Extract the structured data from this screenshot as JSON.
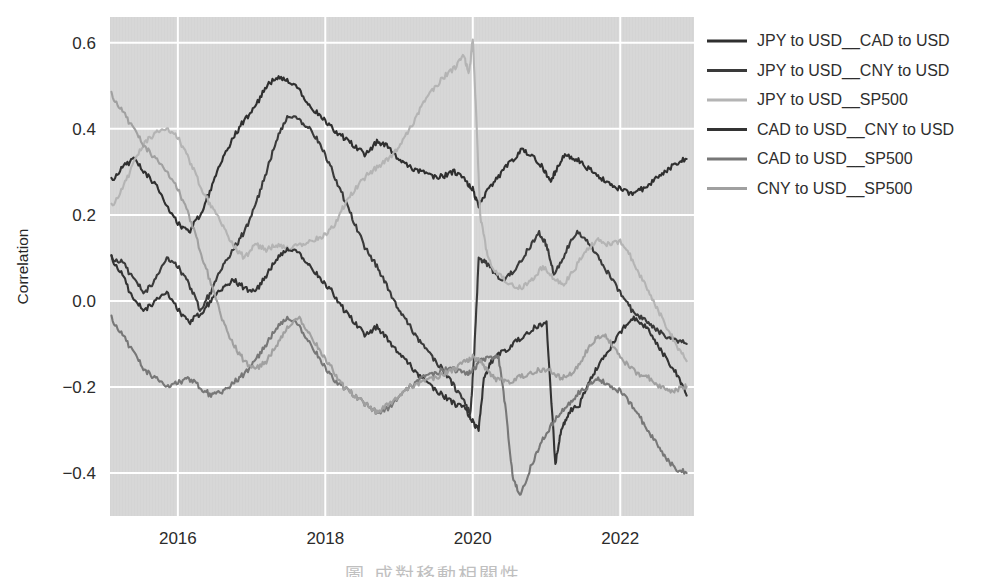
{
  "chart_data": {
    "type": "line",
    "title": "",
    "xlabel": "",
    "ylabel": "Correlation",
    "xlim": [
      2015.08,
      2023.0
    ],
    "ylim": [
      -0.5,
      0.66
    ],
    "grid": true,
    "grid_color": "#ffffff",
    "plot_background": "#d7d7d7",
    "figure_background": "#ffffff",
    "legend_position": "right-outside",
    "x_ticks": [
      "2016",
      "2018",
      "2020",
      "2022"
    ],
    "x_tick_values": [
      2016,
      2018,
      2020,
      2022
    ],
    "y_ticks": [
      "0.6",
      "0.4",
      "0.2",
      "0.0",
      "−0.2",
      "−0.4"
    ],
    "y_tick_values": [
      0.6,
      0.4,
      0.2,
      0.0,
      -0.2,
      -0.4
    ],
    "series": [
      {
        "name": "JPY to USD__CAD to USD",
        "color": "#2f2f2f",
        "x": [
          2015.1,
          2015.25,
          2015.4,
          2015.55,
          2015.7,
          2015.85,
          2016.0,
          2016.15,
          2016.3,
          2016.45,
          2016.6,
          2016.75,
          2016.9,
          2017.05,
          2017.2,
          2017.35,
          2017.5,
          2017.65,
          2017.8,
          2017.95,
          2018.1,
          2018.25,
          2018.4,
          2018.55,
          2018.7,
          2018.85,
          2019.0,
          2019.15,
          2019.3,
          2019.45,
          2019.6,
          2019.75,
          2019.9,
          2020.0,
          2020.08,
          2020.2,
          2020.35,
          2020.5,
          2020.65,
          2020.8,
          2020.95,
          2021.05,
          2021.12,
          2021.25,
          2021.4,
          2021.55,
          2021.7,
          2021.85,
          2022.0,
          2022.15,
          2022.3,
          2022.45,
          2022.6,
          2022.75,
          2022.9
        ],
        "values": [
          0.28,
          0.31,
          0.33,
          0.3,
          0.27,
          0.22,
          0.18,
          0.16,
          0.2,
          0.26,
          0.33,
          0.38,
          0.42,
          0.45,
          0.5,
          0.52,
          0.51,
          0.49,
          0.45,
          0.43,
          0.4,
          0.38,
          0.36,
          0.34,
          0.37,
          0.36,
          0.33,
          0.31,
          0.3,
          0.29,
          0.29,
          0.3,
          0.28,
          0.26,
          0.22,
          0.26,
          0.29,
          0.32,
          0.35,
          0.34,
          0.31,
          0.28,
          0.3,
          0.34,
          0.33,
          0.31,
          0.29,
          0.27,
          0.26,
          0.25,
          0.26,
          0.28,
          0.3,
          0.32,
          0.33
        ]
      },
      {
        "name": "JPY to USD__CNY to USD",
        "color": "#3a3a3a",
        "x": [
          2015.1,
          2015.25,
          2015.4,
          2015.55,
          2015.7,
          2015.85,
          2016.0,
          2016.15,
          2016.3,
          2016.45,
          2016.6,
          2016.75,
          2016.9,
          2017.05,
          2017.2,
          2017.35,
          2017.5,
          2017.65,
          2017.8,
          2017.95,
          2018.1,
          2018.25,
          2018.4,
          2018.55,
          2018.7,
          2018.85,
          2019.0,
          2019.15,
          2019.3,
          2019.45,
          2019.6,
          2019.75,
          2019.9,
          2019.97,
          2020.02,
          2020.08,
          2020.18,
          2020.3,
          2020.45,
          2020.6,
          2020.75,
          2020.9,
          2021.0,
          2021.1,
          2021.25,
          2021.4,
          2021.55,
          2021.7,
          2021.85,
          2022.0,
          2022.15,
          2022.3,
          2022.45,
          2022.6,
          2022.75,
          2022.9
        ],
        "values": [
          0.1,
          0.09,
          0.05,
          0.02,
          0.05,
          0.1,
          0.08,
          0.04,
          -0.02,
          0.02,
          0.08,
          0.12,
          0.16,
          0.22,
          0.3,
          0.38,
          0.43,
          0.42,
          0.4,
          0.36,
          0.3,
          0.24,
          0.18,
          0.12,
          0.08,
          0.03,
          -0.02,
          -0.06,
          -0.1,
          -0.13,
          -0.16,
          -0.2,
          -0.24,
          -0.26,
          -0.12,
          0.1,
          0.09,
          0.06,
          0.05,
          0.08,
          0.12,
          0.16,
          0.13,
          0.06,
          0.11,
          0.16,
          0.14,
          0.1,
          0.06,
          0.02,
          -0.02,
          -0.04,
          -0.06,
          -0.08,
          -0.09,
          -0.1
        ]
      },
      {
        "name": "JPY to USD__SP500",
        "color": "#b4b4b4",
        "x": [
          2015.1,
          2015.25,
          2015.4,
          2015.55,
          2015.7,
          2015.85,
          2016.0,
          2016.15,
          2016.3,
          2016.45,
          2016.6,
          2016.75,
          2016.9,
          2017.05,
          2017.2,
          2017.35,
          2017.5,
          2017.65,
          2017.8,
          2017.95,
          2018.1,
          2018.25,
          2018.4,
          2018.55,
          2018.7,
          2018.85,
          2019.0,
          2019.15,
          2019.3,
          2019.45,
          2019.6,
          2019.75,
          2019.88,
          2019.95,
          2020.0,
          2020.05,
          2020.1,
          2020.2,
          2020.35,
          2020.5,
          2020.65,
          2020.8,
          2020.95,
          2021.1,
          2021.25,
          2021.4,
          2021.55,
          2021.7,
          2021.85,
          2022.0,
          2022.15,
          2022.3,
          2022.45,
          2022.6,
          2022.75,
          2022.9
        ],
        "values": [
          0.22,
          0.26,
          0.32,
          0.37,
          0.39,
          0.4,
          0.38,
          0.33,
          0.27,
          0.22,
          0.18,
          0.13,
          0.1,
          0.13,
          0.12,
          0.13,
          0.12,
          0.13,
          0.14,
          0.15,
          0.17,
          0.22,
          0.26,
          0.29,
          0.31,
          0.33,
          0.36,
          0.4,
          0.45,
          0.49,
          0.52,
          0.54,
          0.57,
          0.53,
          0.61,
          0.42,
          0.2,
          0.1,
          0.06,
          0.04,
          0.03,
          0.05,
          0.08,
          0.05,
          0.04,
          0.08,
          0.12,
          0.14,
          0.13,
          0.14,
          0.1,
          0.05,
          0.0,
          -0.05,
          -0.1,
          -0.14
        ]
      },
      {
        "name": "CAD to USD__CNY to USD",
        "color": "#333333",
        "x": [
          2015.1,
          2015.25,
          2015.4,
          2015.55,
          2015.7,
          2015.85,
          2016.0,
          2016.15,
          2016.3,
          2016.45,
          2016.6,
          2016.75,
          2016.9,
          2017.05,
          2017.2,
          2017.35,
          2017.5,
          2017.65,
          2017.8,
          2017.95,
          2018.1,
          2018.25,
          2018.4,
          2018.55,
          2018.7,
          2018.85,
          2019.0,
          2019.15,
          2019.3,
          2019.45,
          2019.6,
          2019.75,
          2019.9,
          2020.0,
          2020.08,
          2020.15,
          2020.25,
          2020.4,
          2020.55,
          2020.7,
          2020.85,
          2021.0,
          2021.12,
          2021.2,
          2021.3,
          2021.45,
          2021.6,
          2021.75,
          2021.9,
          2022.05,
          2022.2,
          2022.35,
          2022.5,
          2022.65,
          2022.8,
          2022.9
        ],
        "values": [
          0.1,
          0.06,
          0.0,
          -0.02,
          0.0,
          0.02,
          -0.02,
          -0.05,
          -0.03,
          0.0,
          0.03,
          0.05,
          0.03,
          0.02,
          0.06,
          0.1,
          0.12,
          0.11,
          0.08,
          0.05,
          0.02,
          -0.02,
          -0.05,
          -0.08,
          -0.06,
          -0.09,
          -0.12,
          -0.15,
          -0.18,
          -0.2,
          -0.22,
          -0.24,
          -0.25,
          -0.28,
          -0.3,
          -0.18,
          -0.14,
          -0.12,
          -0.1,
          -0.08,
          -0.06,
          -0.05,
          -0.38,
          -0.3,
          -0.26,
          -0.24,
          -0.18,
          -0.14,
          -0.1,
          -0.06,
          -0.04,
          -0.06,
          -0.1,
          -0.14,
          -0.18,
          -0.22
        ]
      },
      {
        "name": "CAD to USD__SP500",
        "color": "#777777",
        "x": [
          2015.1,
          2015.25,
          2015.4,
          2015.55,
          2015.7,
          2015.85,
          2016.0,
          2016.15,
          2016.3,
          2016.45,
          2016.6,
          2016.75,
          2016.9,
          2017.05,
          2017.2,
          2017.35,
          2017.5,
          2017.65,
          2017.8,
          2017.95,
          2018.1,
          2018.25,
          2018.4,
          2018.55,
          2018.7,
          2018.85,
          2019.0,
          2019.15,
          2019.3,
          2019.45,
          2019.6,
          2019.75,
          2019.9,
          2020.0,
          2020.1,
          2020.2,
          2020.35,
          2020.45,
          2020.55,
          2020.65,
          2020.8,
          2020.95,
          2021.1,
          2021.25,
          2021.4,
          2021.55,
          2021.7,
          2021.85,
          2022.0,
          2022.15,
          2022.3,
          2022.45,
          2022.6,
          2022.75,
          2022.9
        ],
        "values": [
          -0.04,
          -0.08,
          -0.12,
          -0.16,
          -0.18,
          -0.2,
          -0.19,
          -0.18,
          -0.2,
          -0.22,
          -0.21,
          -0.19,
          -0.17,
          -0.14,
          -0.1,
          -0.06,
          -0.04,
          -0.06,
          -0.1,
          -0.14,
          -0.18,
          -0.2,
          -0.22,
          -0.24,
          -0.26,
          -0.25,
          -0.22,
          -0.2,
          -0.18,
          -0.17,
          -0.16,
          -0.16,
          -0.17,
          -0.16,
          -0.14,
          -0.13,
          -0.13,
          -0.26,
          -0.42,
          -0.45,
          -0.38,
          -0.32,
          -0.28,
          -0.25,
          -0.22,
          -0.2,
          -0.18,
          -0.2,
          -0.21,
          -0.24,
          -0.28,
          -0.32,
          -0.36,
          -0.39,
          -0.4
        ]
      },
      {
        "name": "CNY to USD__SP500",
        "color": "#a0a0a0",
        "x": [
          2015.1,
          2015.25,
          2015.4,
          2015.55,
          2015.7,
          2015.85,
          2016.0,
          2016.15,
          2016.3,
          2016.45,
          2016.6,
          2016.75,
          2016.9,
          2017.05,
          2017.2,
          2017.35,
          2017.5,
          2017.65,
          2017.8,
          2017.95,
          2018.1,
          2018.25,
          2018.4,
          2018.55,
          2018.7,
          2018.85,
          2019.0,
          2019.15,
          2019.3,
          2019.45,
          2019.6,
          2019.75,
          2019.9,
          2020.0,
          2020.1,
          2020.2,
          2020.3,
          2020.45,
          2020.6,
          2020.75,
          2020.9,
          2021.05,
          2021.2,
          2021.35,
          2021.5,
          2021.65,
          2021.8,
          2021.95,
          2022.1,
          2022.25,
          2022.4,
          2022.55,
          2022.7,
          2022.85,
          2022.9
        ],
        "values": [
          0.48,
          0.44,
          0.4,
          0.36,
          0.33,
          0.3,
          0.26,
          0.2,
          0.12,
          0.04,
          -0.04,
          -0.1,
          -0.14,
          -0.16,
          -0.14,
          -0.1,
          -0.06,
          -0.04,
          -0.08,
          -0.12,
          -0.16,
          -0.2,
          -0.22,
          -0.24,
          -0.26,
          -0.24,
          -0.22,
          -0.2,
          -0.19,
          -0.18,
          -0.17,
          -0.16,
          -0.14,
          -0.13,
          -0.14,
          -0.16,
          -0.18,
          -0.19,
          -0.18,
          -0.17,
          -0.16,
          -0.16,
          -0.18,
          -0.17,
          -0.13,
          -0.09,
          -0.08,
          -0.12,
          -0.15,
          -0.17,
          -0.18,
          -0.2,
          -0.21,
          -0.2,
          -0.2
        ]
      }
    ]
  },
  "legend": {
    "entries": [
      {
        "label": "JPY to USD__CAD to USD",
        "color": "#2f2f2f"
      },
      {
        "label": "JPY to USD__CNY to USD",
        "color": "#3a3a3a"
      },
      {
        "label": "JPY to USD__SP500",
        "color": "#b4b4b4"
      },
      {
        "label": "CAD to USD__CNY to USD",
        "color": "#333333"
      },
      {
        "label": "CAD to USD__SP500",
        "color": "#777777"
      },
      {
        "label": "CNY to USD__SP500",
        "color": "#a0a0a0"
      }
    ]
  },
  "footer": {
    "partial_caption": "圖 成對移動相關性"
  }
}
